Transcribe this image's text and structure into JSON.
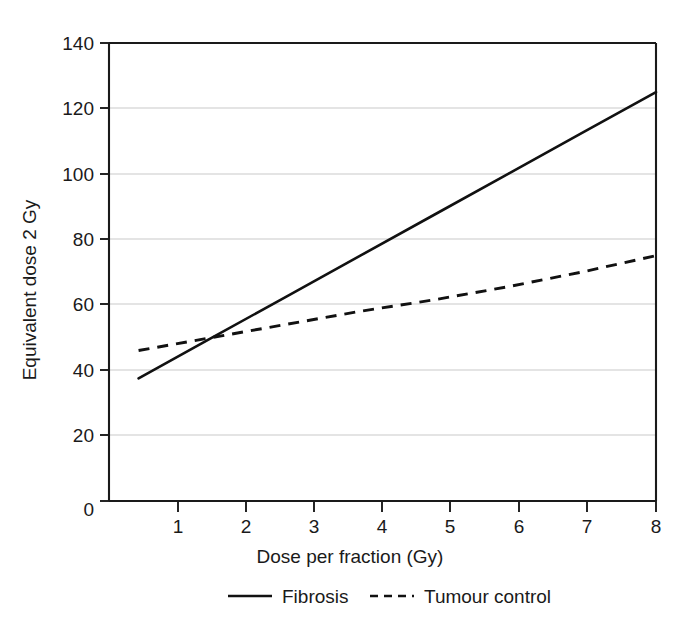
{
  "chart_data": {
    "type": "line",
    "title": "",
    "xlabel": "Dose per fraction (Gy)",
    "ylabel": "Equivalent dose 2 Gy",
    "xlim": [
      0.6,
      8
    ],
    "ylim": [
      0,
      140
    ],
    "xticks": [
      1,
      2,
      3,
      4,
      5,
      6,
      7,
      8
    ],
    "xtick_labels": [
      "1",
      "2",
      "3",
      "4",
      "5",
      "6",
      "7",
      "8"
    ],
    "yticks": [
      0,
      20,
      40,
      60,
      80,
      100,
      120,
      140
    ],
    "ytick_labels": [
      "0",
      "20",
      "40",
      "60",
      "80",
      "100",
      "120",
      "140"
    ],
    "grid": "horizontal",
    "legend_position": "below",
    "x": [
      1,
      2,
      3,
      4,
      5,
      6,
      7,
      8
    ],
    "series": [
      {
        "name": "Fibrosis",
        "style": "solid",
        "color": "#111111",
        "values": [
          37.5,
          50,
          62.5,
          75,
          87.5,
          100,
          112.5,
          125
        ]
      },
      {
        "name": "Tumour control",
        "style": "dashed",
        "color": "#111111",
        "values": [
          46,
          50,
          54,
          58,
          61.5,
          65.5,
          70,
          75
        ]
      }
    ]
  },
  "axes": {
    "y_title": "Equivalent dose 2 Gy",
    "x_title": "Dose per fraction (Gy)",
    "y_tick_labels": [
      "140",
      "120",
      "100",
      "80",
      "60",
      "40",
      "20",
      "0"
    ],
    "x_tick_labels": [
      "1",
      "2",
      "3",
      "4",
      "5",
      "6",
      "7",
      "8"
    ]
  },
  "legend": {
    "entries": [
      {
        "label": "Fibrosis",
        "style": "solid"
      },
      {
        "label": "Tumour control",
        "style": "dashed"
      }
    ]
  },
  "colors": {
    "background": "#ffffff",
    "axis": "#1a1a1a",
    "grid": "#c9c9c9",
    "series": "#111111"
  }
}
